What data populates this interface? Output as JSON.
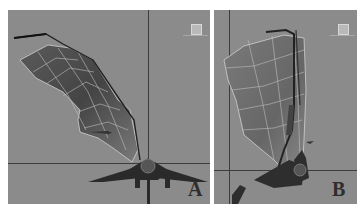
{
  "panels": [
    {
      "id": "A",
      "label": "A",
      "view": "front-view",
      "background": "#8b8b8b"
    },
    {
      "id": "B",
      "label": "B",
      "view": "side-view",
      "background": "#8b8b8b"
    }
  ],
  "colors": {
    "viewport_bg": "#8b8b8b",
    "axis_line": "#3d3d3d",
    "wing_mesh_dark": "#4a4a4a",
    "wing_mesh_light": "#8e8e8e",
    "wireframe": "#c8c8c8",
    "page_bg": "#ffffff"
  }
}
